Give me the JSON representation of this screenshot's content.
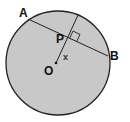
{
  "diagram": {
    "type": "geometry",
    "circle": {
      "cx": 58,
      "cy": 63,
      "r": 52,
      "fill": "#c8c8c8",
      "stroke": "#222222"
    },
    "chord": {
      "from": "A",
      "to": "B"
    },
    "perpendicular": {
      "from": "O",
      "through": "P",
      "right_angle_marker": true
    },
    "points": {
      "A": {
        "x": 27,
        "y": 21
      },
      "B": {
        "x": 108,
        "y": 57
      },
      "P": {
        "x": 70,
        "y": 39
      },
      "O": {
        "x": 57,
        "y": 63
      }
    },
    "labels": {
      "A": "A",
      "B": "B",
      "P": "P",
      "O": "O",
      "x": "x"
    }
  }
}
